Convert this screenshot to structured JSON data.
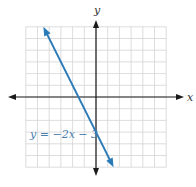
{
  "chart_data": {
    "type": "line",
    "title": "",
    "xlabel": "x",
    "ylabel": "y",
    "xlim": [
      -6,
      6
    ],
    "ylim": [
      -6,
      6
    ],
    "grid": true,
    "grid_step": 1,
    "series": [
      {
        "name": "y = −2x − 3",
        "equation": "y = -2x - 3",
        "slope": -2,
        "intercept": -3,
        "x": [
          -4.5,
          1.5
        ],
        "y": [
          6,
          -6
        ],
        "color": "#2a7ab8"
      }
    ],
    "annotations": [
      {
        "text": "y = −2x − 3",
        "x": -4.8,
        "y": -3.6
      }
    ]
  },
  "axes": {
    "x_label": "x",
    "y_label": "y"
  },
  "line_label": "y = −2x − 3",
  "colors": {
    "line": "#2a7ab8",
    "grid": "#d4d4d4",
    "axis": "#1a1a1a",
    "label": "#4a7fb0"
  }
}
